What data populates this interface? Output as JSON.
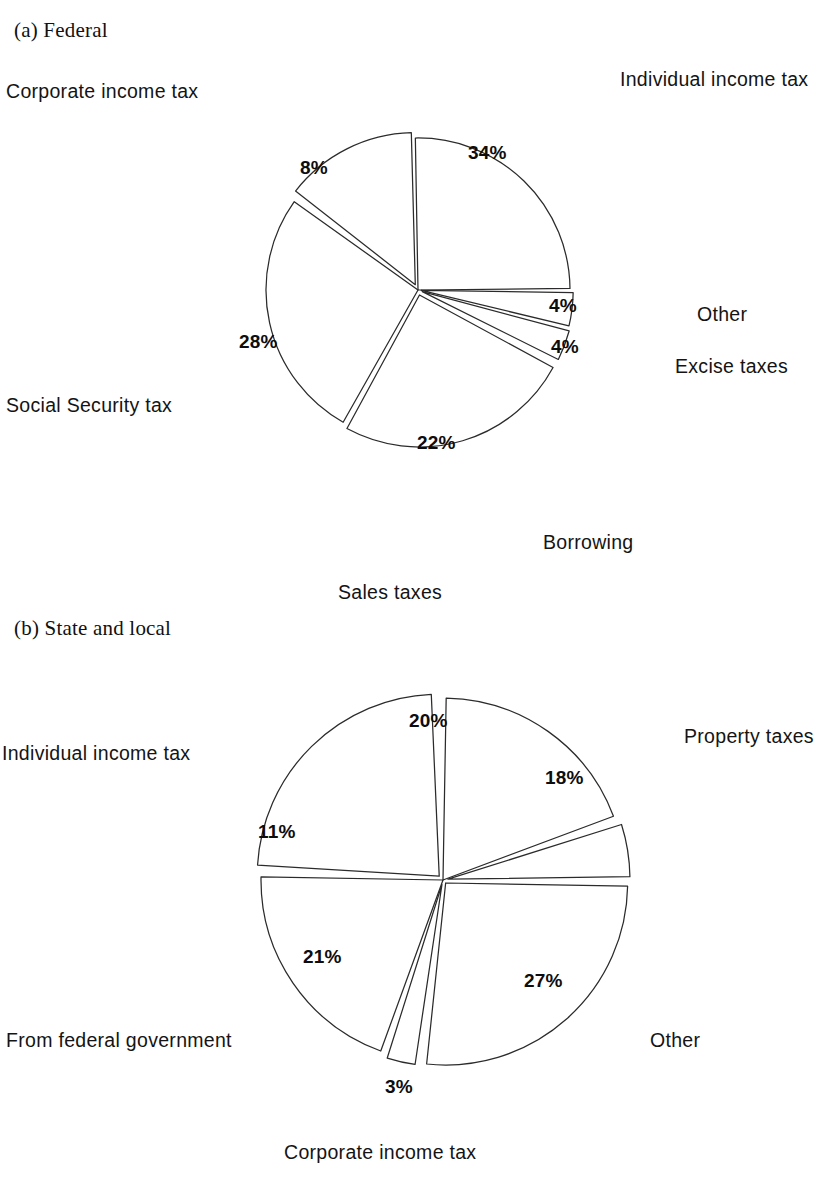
{
  "page": {
    "background": "#ffffff",
    "ink": "#2b2b2b"
  },
  "panels": [
    {
      "id": "federal",
      "title": "(a)  Federal",
      "title_pos": {
        "x": 14,
        "y": 18
      },
      "center": {
        "x": 418,
        "y": 290
      },
      "radius": 152
    },
    {
      "id": "state-and-local",
      "title": "(b)  State and local",
      "title_pos": {
        "x": 14,
        "y": 616
      },
      "center": {
        "x": 443,
        "y": 880
      },
      "radius": 182
    }
  ],
  "federal": {
    "title": "(a)  Federal",
    "labels": {
      "individual": "Individual income tax",
      "corporate": "Corporate income tax",
      "social": "Social Security tax",
      "other": "Other",
      "excise": "Excise taxes",
      "borrowing": "Borrowing"
    },
    "values": {
      "individual": "34%",
      "corporate": "8%",
      "social": "28%",
      "other": "4%",
      "excise": "4%",
      "borrowing": "22%"
    }
  },
  "state": {
    "title": "(b)  State and local",
    "labels": {
      "sales": "Sales taxes",
      "property": "Property taxes",
      "other": "Other",
      "corporate": "Corporate income tax",
      "federal_aid": "From federal government",
      "individual": "Individual income tax"
    },
    "values": {
      "sales": "20%",
      "property": "18%",
      "other": "27%",
      "corporate": "3%",
      "federal_aid": "21%",
      "individual": "11%"
    }
  },
  "chart_data": [
    {
      "type": "pie",
      "title": "(a)  Federal",
      "unit": "percent",
      "legend": "labels placed outside slices",
      "categories": [
        "Individual income tax",
        "Other",
        "Excise taxes",
        "Borrowing",
        "Social Security tax",
        "Corporate income tax"
      ],
      "values": [
        34,
        4,
        4,
        22,
        28,
        8
      ],
      "value_labels": [
        "34%",
        "4%",
        "4%",
        "22%",
        "28%",
        "8%"
      ],
      "exploded": [
        "Other",
        "Excise taxes",
        "Borrowing",
        "Corporate income tax"
      ],
      "total": 100
    },
    {
      "type": "pie",
      "title": "(b)  State and local",
      "unit": "percent",
      "legend": "labels placed outside slices",
      "categories": [
        "Sales taxes",
        "Property taxes",
        "Other",
        "Corporate income tax",
        "From federal government",
        "Individual income tax"
      ],
      "values": [
        20,
        18,
        27,
        3,
        21,
        11
      ],
      "value_labels": [
        "20%",
        "18%",
        "27%",
        "3%",
        "21%",
        "11%"
      ],
      "exploded": [
        "Property taxes",
        "Corporate income tax",
        "Individual income tax"
      ],
      "total": 100
    }
  ],
  "geometry": {
    "federal_slices": [
      {
        "key": "individual",
        "a0": -91,
        "a1": -0.6,
        "burst": 0
      },
      {
        "key": "other",
        "a0": 0.8,
        "a1": 13.5,
        "burst": 3.2
      },
      {
        "key": "excise",
        "a0": 15.0,
        "a1": 26.5,
        "burst": 4.6
      },
      {
        "key": "borrowing",
        "a0": 28.5,
        "a1": 118.5,
        "burst": 5.2
      },
      {
        "key": "social",
        "a0": 119.5,
        "a1": 215.5,
        "burst": 0
      },
      {
        "key": "corporate",
        "a0": 218.0,
        "a1": 268.5,
        "burst": 6.0
      }
    ],
    "state_slices": [
      {
        "key": "sales",
        "a0": -89,
        "a1": -20.5,
        "burst": 0
      },
      {
        "key": "property",
        "a0": -17.5,
        "a1": -0.8,
        "burst": 5.0
      },
      {
        "key": "other",
        "a0": 1.0,
        "a1": 96.0,
        "burst": 4.0
      },
      {
        "key": "corporate",
        "a0": 98.5,
        "a1": 107.5,
        "burst": 4.6
      },
      {
        "key": "federal_aid",
        "a0": 110.0,
        "a1": 181.0,
        "burst": 0
      },
      {
        "key": "individual",
        "a0": 183.5,
        "a1": 267.5,
        "burst": 5.4
      }
    ]
  },
  "positions": {
    "federal": {
      "label_individual": {
        "x": 620,
        "y": 68
      },
      "label_corporate": {
        "x": 6,
        "y": 80
      },
      "label_social": {
        "x": 6,
        "y": 394
      },
      "label_other": {
        "x": 697,
        "y": 303
      },
      "label_excise": {
        "x": 675,
        "y": 355
      },
      "label_borrowing": {
        "x": 543,
        "y": 531
      },
      "val_individual": {
        "x": 468,
        "y": 142
      },
      "val_corporate": {
        "x": 300,
        "y": 157
      },
      "val_social": {
        "x": 239,
        "y": 331
      },
      "val_other": {
        "x": 549,
        "y": 295
      },
      "val_excise": {
        "x": 551,
        "y": 336
      },
      "val_borrowing": {
        "x": 417,
        "y": 432
      }
    },
    "state": {
      "label_sales": {
        "x": 338,
        "y": 581
      },
      "label_property": {
        "x": 684,
        "y": 725
      },
      "label_other": {
        "x": 650,
        "y": 1029
      },
      "label_corporate": {
        "x": 284,
        "y": 1141
      },
      "label_federal": {
        "x": 6,
        "y": 1029
      },
      "label_individual": {
        "x": 2,
        "y": 742
      },
      "val_sales": {
        "x": 409,
        "y": 710
      },
      "val_property": {
        "x": 545,
        "y": 767
      },
      "val_other": {
        "x": 524,
        "y": 970
      },
      "val_corporate": {
        "x": 385,
        "y": 1076
      },
      "val_federal": {
        "x": 303,
        "y": 946
      },
      "val_individual": {
        "x": 258,
        "y": 821
      }
    }
  }
}
